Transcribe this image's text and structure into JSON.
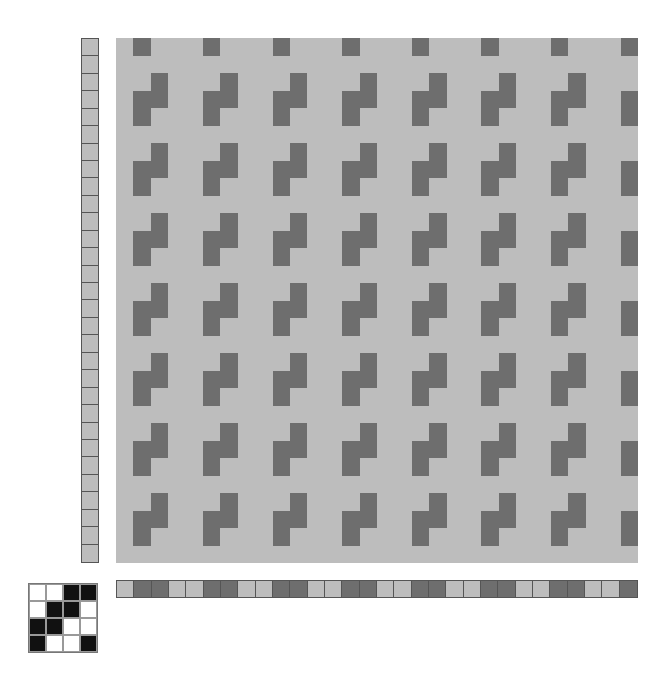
{
  "colors": {
    "light": "#bdbdbd",
    "dark": "#6e6e6e",
    "tieup_on": "#111111",
    "tieup_off": "#ffffff",
    "border": "#555555"
  },
  "drawdown": {
    "cols": 30,
    "rows": 30,
    "repeat_block": [
      [
        0,
        1,
        0,
        0
      ],
      [
        0,
        0,
        0,
        0
      ],
      [
        0,
        0,
        1,
        0
      ],
      [
        0,
        1,
        1,
        0
      ]
    ]
  },
  "threading": {
    "count": 30,
    "repeat": [
      0,
      1,
      1,
      0
    ]
  },
  "treadling": {
    "count": 30,
    "repeat": [
      0
    ]
  },
  "tieup": {
    "grid": [
      [
        0,
        0,
        1,
        1
      ],
      [
        0,
        1,
        1,
        0
      ],
      [
        1,
        1,
        0,
        0
      ],
      [
        1,
        0,
        0,
        1
      ]
    ]
  }
}
